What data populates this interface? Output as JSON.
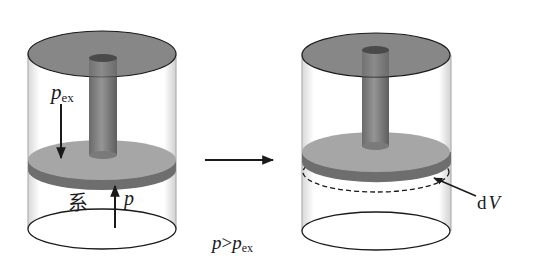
{
  "labels": {
    "p_ex_main": "p",
    "p_ex_sub": "ex",
    "system": "系",
    "p_internal": "p",
    "condition_p": "p",
    "condition_gt": ">",
    "condition_pex": "p",
    "condition_pex_sub": "ex",
    "dV_d": "d",
    "dV_V": "V"
  },
  "colors": {
    "lid": "#7d7d7d",
    "rod": "#808080",
    "piston_top": "#a6a6a6",
    "piston_side": "#6e6e6e",
    "outline": "#1a1a1a",
    "wall": "#bdbdbd"
  }
}
